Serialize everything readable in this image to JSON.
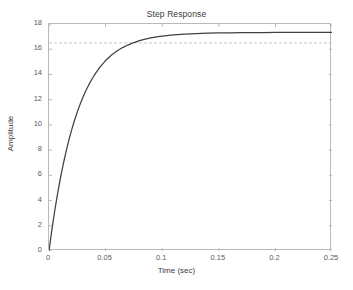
{
  "figure": {
    "title": "Step Response",
    "xlabel": "Time (sec)",
    "ylabel": "Amplitude"
  },
  "chart_data": {
    "type": "line",
    "title": "Step Response",
    "xlabel": "Time (sec)",
    "ylabel": "Amplitude",
    "xlim": [
      0,
      0.25
    ],
    "ylim": [
      0,
      18
    ],
    "xticks": [
      0,
      0.05,
      0.1,
      0.15,
      0.2,
      0.25
    ],
    "xtick_labels": [
      "0",
      "0.05",
      "0.1",
      "0.15",
      "0.2",
      "0.25"
    ],
    "yticks": [
      0,
      2,
      4,
      6,
      8,
      10,
      12,
      14,
      16,
      18
    ],
    "ytick_labels": [
      "0",
      "2",
      "4",
      "6",
      "8",
      "10",
      "12",
      "14",
      "16",
      "18"
    ],
    "grid": false,
    "legend": null,
    "line_color": "#404040",
    "reference_line": {
      "name": "steady-state",
      "value": 16.5,
      "style": "dashed",
      "color": "#c8c8c8",
      "orientation": "horizontal"
    },
    "series": [
      {
        "name": "step response",
        "final_value": 16.5,
        "time_constant": 0.0238,
        "x": [
          0,
          0.0025,
          0.005,
          0.0075,
          0.01,
          0.0125,
          0.015,
          0.0175,
          0.02,
          0.0225,
          0.025,
          0.0275,
          0.03,
          0.0325,
          0.035,
          0.0375,
          0.04,
          0.045,
          0.05,
          0.055,
          0.06,
          0.065,
          0.07,
          0.075,
          0.08,
          0.085,
          0.09,
          0.095,
          0.1,
          0.11,
          0.12,
          0.13,
          0.14,
          0.15,
          0.16,
          0.17,
          0.18,
          0.19,
          0.2,
          0.21,
          0.22,
          0.23,
          0.24,
          0.25
        ],
        "y": [
          0.0,
          1.65,
          3.15,
          4.51,
          5.74,
          6.85,
          7.86,
          8.77,
          9.6,
          10.35,
          11.03,
          11.64,
          12.19,
          12.7,
          13.15,
          13.56,
          13.94,
          14.58,
          15.1,
          15.52,
          15.86,
          16.13,
          16.35,
          16.53,
          16.68,
          16.8,
          16.9,
          16.98,
          17.04,
          17.13,
          17.2,
          17.24,
          17.27,
          17.29,
          17.3,
          17.31,
          17.32,
          17.32,
          17.33,
          17.33,
          17.33,
          17.33,
          17.33,
          17.33
        ]
      }
    ]
  }
}
